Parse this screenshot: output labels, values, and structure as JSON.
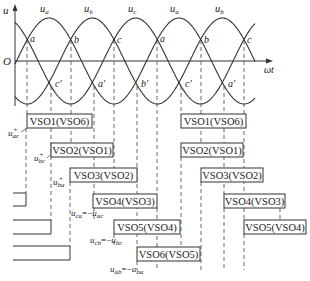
{
  "figure": {
    "axes": {
      "y_label": "u",
      "x_label": "ωt",
      "origin_label": "O"
    },
    "waves": [
      {
        "name": "u_a",
        "label": "u",
        "sub": "a"
      },
      {
        "name": "u_b",
        "label": "u",
        "sub": "b"
      },
      {
        "name": "u_c",
        "label": "u",
        "sub": "c"
      },
      {
        "name": "u_a",
        "label": "u",
        "sub": "a"
      },
      {
        "name": "u_b",
        "label": "u",
        "sub": "b"
      }
    ],
    "upper_crossings": [
      "a",
      "b",
      "c",
      "a",
      "b",
      "c"
    ],
    "lower_crossings": [
      "c'",
      "a'",
      "b'",
      "c'",
      "a'"
    ],
    "conduction_boxes_row1": [
      "VSO1(VSO6)",
      "VSO2(VSO1)",
      "VSO3(VSO2)",
      "VSO4(VSO3)",
      "VSO5(VSO4)",
      "VSO6(VSO5)"
    ],
    "conduction_boxes_row2": [
      "VSO1(VSO6)",
      "VSO2(VSO1)",
      "VSO3(VSO2)",
      "VSO4(VSO3)",
      "VSO5(VSO4)"
    ],
    "voltage_labels": [
      {
        "id": "u_ac_plus",
        "text": "u",
        "sub": "ac",
        "sup": "+"
      },
      {
        "id": "u_bc_plus",
        "text": "u",
        "sub": "bc",
        "sup": "+"
      },
      {
        "id": "u_ba_plus",
        "text": "u",
        "sub": "ba",
        "sup": "+"
      },
      {
        "id": "u_ca_eq",
        "text": "u",
        "sub": "ca",
        "sup": "+",
        "eq": "=−",
        "text2": "u",
        "sub2": "ac",
        "sup2": "+"
      },
      {
        "id": "u_cb_eq",
        "text": "u",
        "sub": "cb",
        "sup": "+",
        "eq": "=−",
        "text2": "u",
        "sub2": "bc",
        "sup2": "+"
      },
      {
        "id": "u_ab_eq",
        "text": "u",
        "sub": "ab",
        "sup": "+",
        "eq": "=−",
        "text2": "u",
        "sub2": "ba",
        "sup2": "+"
      }
    ]
  }
}
